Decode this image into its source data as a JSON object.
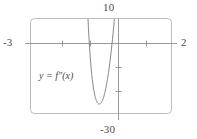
{
  "figure": {
    "name": "graphing-calculator-viewport",
    "frame_color": "#b9b9b9",
    "axis_color": "#8f8f8f",
    "curve_color": "#7a7a7a",
    "background": "#ffffff"
  },
  "labels": {
    "y_max": "10",
    "y_min": "-30",
    "x_min": "-3",
    "x_max": "2",
    "curve_equation": "y = f″(x)"
  },
  "chart_data": {
    "type": "line",
    "title": "",
    "subtitle": "",
    "xlabel": "",
    "ylabel": "",
    "xlim": [
      -3,
      2
    ],
    "ylim": [
      -30,
      10
    ],
    "grid": false,
    "legend": "none",
    "annotations": [
      {
        "text": "y = f″(x)",
        "x": -1.9,
        "y": -11.5,
        "name": "curve-equation-annotation"
      },
      {
        "text": "10",
        "x": 0,
        "y": 10,
        "name": "y-max-tick-label"
      },
      {
        "text": "-30",
        "x": 0,
        "y": -30,
        "name": "y-min-tick-label"
      },
      {
        "text": "-3",
        "x": -3,
        "y": 0,
        "name": "x-min-tick-label"
      },
      {
        "text": "2",
        "x": 2,
        "y": 0,
        "name": "x-max-tick-label"
      }
    ],
    "x_ticks": [
      -2,
      -1,
      0,
      1
    ],
    "y_ticks": [
      -20,
      -10,
      0
    ],
    "series": [
      {
        "name": "f''(x)",
        "x": [
          -0.965,
          -0.95,
          -0.93,
          -0.91,
          -0.89,
          -0.87,
          -0.85,
          -0.83,
          -0.81,
          -0.79,
          -0.77,
          -0.75,
          -0.73,
          -0.71,
          -0.69,
          -0.67,
          -0.65,
          -0.63,
          -0.61,
          -0.59,
          -0.57,
          -0.55,
          -0.53,
          -0.51,
          -0.49,
          -0.47,
          -0.45,
          -0.43,
          -0.41,
          -0.39,
          -0.37,
          -0.35,
          -0.33,
          -0.31,
          -0.29,
          -0.27,
          -0.25,
          -0.23,
          -0.21,
          -0.19,
          -0.17,
          -0.15,
          -0.13,
          -0.11,
          -0.09,
          -0.07,
          -0.05,
          -0.03,
          -0.01,
          0.01,
          0.03,
          0.05,
          0.07,
          0.09,
          0.11,
          0.13,
          0.15,
          0.17,
          0.19,
          0.21,
          0.23,
          0.25,
          0.27,
          0.29,
          0.31,
          0.33,
          0.35,
          0.37,
          0.39,
          0.41,
          0.43,
          0.45,
          0.47,
          0.49
        ],
        "y": [
          10.0,
          6.4,
          2.1,
          -1.8,
          -5.3,
          -8.4,
          -11.2,
          -13.6,
          -15.8,
          -17.7,
          -19.3,
          -20.8,
          -22.0,
          -23.0,
          -23.9,
          -24.6,
          -25.2,
          -25.6,
          -25.9,
          -26.1,
          -26.2,
          -26.2,
          -26.1,
          -25.9,
          -25.6,
          -25.2,
          -24.7,
          -24.1,
          -23.4,
          -22.6,
          -21.7,
          -20.7,
          -19.6,
          -18.4,
          -17.1,
          -15.7,
          -14.2,
          -12.6,
          -10.9,
          -9.1,
          -7.2,
          -5.2,
          -3.1,
          -0.9,
          1.4,
          3.8,
          6.3,
          8.9,
          11.6,
          14.4,
          17.3,
          20.3,
          23.4,
          26.6,
          29.9,
          33.3,
          36.8,
          40.4,
          44.1,
          47.9,
          51.8,
          55.8,
          59.9,
          64.1,
          68.4,
          72.8,
          77.3,
          81.9,
          86.6,
          91.4,
          96.3,
          101.3,
          106.4,
          111.6
        ],
        "color": "#7a7a7a",
        "style": "solid",
        "width": 0.9,
        "description": "Steep U-shaped curve with minimum near x = -0.56, y = -26.2; crosses x-axis near x = -0.12 and rises off the top of the window."
      }
    ]
  }
}
